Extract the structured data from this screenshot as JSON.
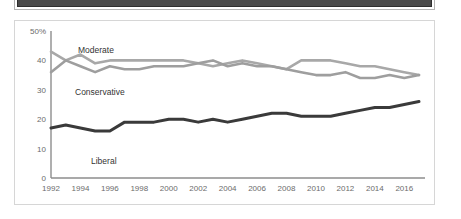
{
  "banner": {
    "name": "top-dark-bar",
    "color": "#4a4a4a"
  },
  "chart_data": {
    "type": "line",
    "title": "",
    "subtitle": "",
    "xlabel": "",
    "ylabel": "",
    "xlim": [
      1992,
      2017
    ],
    "ylim": [
      0,
      50
    ],
    "grid": false,
    "legend_position": "inline-labels",
    "y_ticks": [
      "0",
      "10",
      "20",
      "30",
      "40",
      "50%"
    ],
    "y_tick_values": [
      0,
      10,
      20,
      30,
      40,
      50
    ],
    "x_ticks": [
      "1992",
      "1994",
      "1996",
      "1998",
      "2000",
      "2002",
      "2004",
      "2006",
      "2008",
      "2010",
      "2012",
      "2014",
      "2016"
    ],
    "x_tick_values": [
      1992,
      1994,
      1996,
      1998,
      2000,
      2002,
      2004,
      2006,
      2008,
      2010,
      2012,
      2014,
      2016
    ],
    "x": [
      1992,
      1993,
      1994,
      1995,
      1996,
      1997,
      1998,
      1999,
      2000,
      2001,
      2002,
      2003,
      2004,
      2005,
      2006,
      2007,
      2008,
      2009,
      2010,
      2011,
      2012,
      2013,
      2014,
      2015,
      2016,
      2017
    ],
    "series": [
      {
        "name": "Moderate",
        "color": "#a8a8a8",
        "label_text": "Moderate",
        "values": [
          43,
          40,
          42,
          39,
          40,
          40,
          40,
          40,
          40,
          40,
          39,
          38,
          39,
          40,
          39,
          38,
          37,
          40,
          40,
          40,
          39,
          38,
          38,
          37,
          36,
          35
        ]
      },
      {
        "name": "Conservative",
        "color": "#9e9e9e",
        "label_text": "Conservative",
        "values": [
          36,
          40,
          38,
          36,
          38,
          37,
          37,
          38,
          38,
          38,
          39,
          40,
          38,
          39,
          38,
          38,
          37,
          36,
          35,
          35,
          36,
          34,
          34,
          35,
          34,
          35
        ]
      },
      {
        "name": "Liberal",
        "color": "#3a3a3a",
        "label_text": "Liberal",
        "values": [
          17,
          18,
          17,
          16,
          16,
          19,
          19,
          19,
          20,
          20,
          19,
          20,
          19,
          20,
          21,
          22,
          22,
          21,
          21,
          21,
          22,
          23,
          24,
          24,
          25,
          26
        ]
      }
    ]
  }
}
